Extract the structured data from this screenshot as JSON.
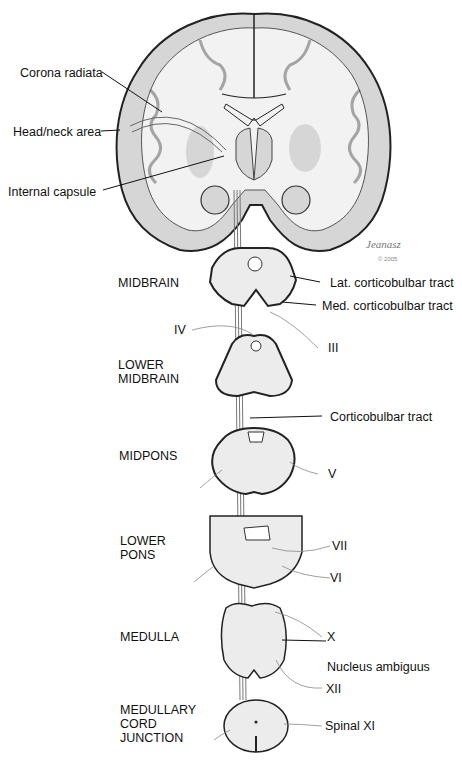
{
  "figure": {
    "signature": "Jeanasz",
    "copyright": "© 2005"
  },
  "brain_labels": {
    "corona_radiata": "Corona radiata",
    "head_neck_area": "Head/neck area",
    "internal_capsule": "Internal capsule"
  },
  "levels": [
    {
      "id": "midbrain",
      "label": "MIDBRAIN"
    },
    {
      "id": "lower-midbrain",
      "label": "LOWER\nMIDBRAIN"
    },
    {
      "id": "midpons",
      "label": "MIDPONS"
    },
    {
      "id": "lower-pons",
      "label": "LOWER\nPONS"
    },
    {
      "id": "medulla",
      "label": "MEDULLA"
    },
    {
      "id": "medullary-cord-junction",
      "label": "MEDULLARY\nCORD\nJUNCTION"
    }
  ],
  "structure_labels": {
    "lat_corticobulbar": "Lat. corticobulbar tract",
    "med_corticobulbar": "Med. corticobulbar tract",
    "corticobulbar": "Corticobulbar tract",
    "nucleus_ambiguus": "Nucleus ambiguus",
    "spinal_xi": "Spinal XI"
  },
  "cranial_nerves": {
    "iv": "IV",
    "iii": "III",
    "v": "V",
    "vii": "VII",
    "vi": "VI",
    "x": "X",
    "xii": "XII"
  },
  "colors": {
    "outline": "#222222",
    "gray_matter": "#d6d6d6",
    "white_matter": "#f2f2f2",
    "background": "#ffffff"
  }
}
